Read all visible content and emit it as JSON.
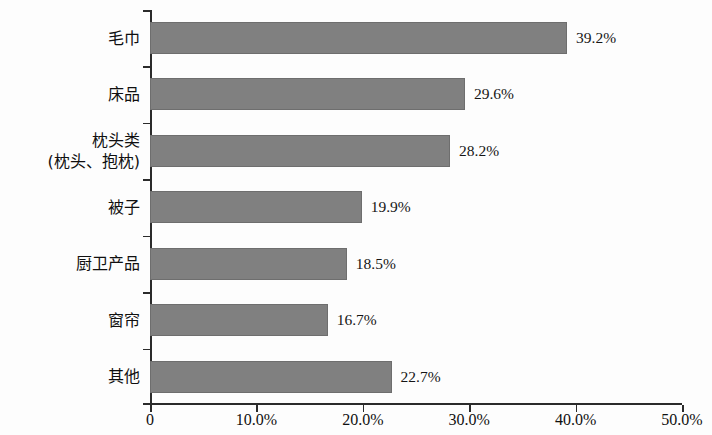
{
  "chart_data": {
    "type": "bar",
    "orientation": "horizontal",
    "title": "",
    "subtitle": "",
    "xlabel": "",
    "ylabel": "",
    "categories": [
      "毛巾",
      "床品",
      "枕头类\n(枕头、抱枕)",
      "被子",
      "厨卫产品",
      "窗帘",
      "其他"
    ],
    "values": [
      39.2,
      29.6,
      28.2,
      19.9,
      18.5,
      16.7,
      22.7
    ],
    "data_labels": [
      "39.2%",
      "29.6%",
      "28.2%",
      "19.9%",
      "18.5%",
      "16.7%",
      "22.7%"
    ],
    "xlim": [
      0,
      50
    ],
    "xticks": [
      0,
      10,
      20,
      30,
      40,
      50
    ],
    "xticklabels": [
      "0",
      "10.0%",
      "20.0%",
      "30.0%",
      "40.0%",
      "50.0%"
    ],
    "grid": false,
    "legend": null,
    "bar_color": "#808080",
    "axis_color": "#2b2b2b",
    "background": "#ffffff"
  },
  "categories": [
    {
      "line1": "毛巾",
      "line2": "",
      "value": 39.2,
      "label": "39.2%"
    },
    {
      "line1": "床品",
      "line2": "",
      "value": 29.6,
      "label": "29.6%"
    },
    {
      "line1": "枕头类",
      "line2": "(枕头、抱枕)",
      "value": 28.2,
      "label": "28.2%"
    },
    {
      "line1": "被子",
      "line2": "",
      "value": 19.9,
      "label": "19.9%"
    },
    {
      "line1": "厨卫产品",
      "line2": "",
      "value": 18.5,
      "label": "18.5%"
    },
    {
      "line1": "窗帘",
      "line2": "",
      "value": 16.7,
      "label": "16.7%"
    },
    {
      "line1": "其他",
      "line2": "",
      "value": 22.7,
      "label": "22.7%"
    }
  ],
  "xaxis": {
    "ticks": [
      {
        "value": 0,
        "label": "0"
      },
      {
        "value": 10,
        "label": "10.0%"
      },
      {
        "value": 20,
        "label": "20.0%"
      },
      {
        "value": 30,
        "label": "30.0%"
      },
      {
        "value": 40,
        "label": "40.0%"
      },
      {
        "value": 50,
        "label": "50.0%"
      }
    ]
  }
}
